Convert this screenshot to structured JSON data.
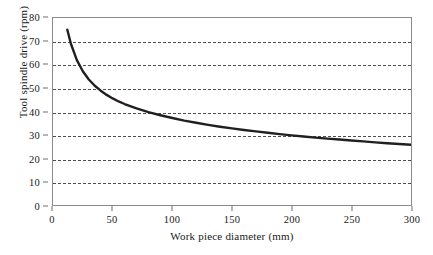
{
  "chart_data": {
    "type": "line",
    "title": "",
    "xlabel": "Work piece diameter (mm)",
    "ylabel": "Tool spindle drive (rpm)",
    "xlim": [
      0,
      300
    ],
    "ylim": [
      0,
      80
    ],
    "xticks": [
      0,
      50,
      100,
      150,
      200,
      250,
      300
    ],
    "yticks": [
      0,
      10,
      20,
      30,
      40,
      50,
      60,
      70,
      80
    ],
    "grid": "horizontal-dashed",
    "legend": "none",
    "series": [
      {
        "name": "Tool spindle drive",
        "color": "#231f20",
        "linewidth": 2.4,
        "x": [
          12,
          15,
          20,
          25,
          30,
          35,
          40,
          45,
          50,
          55,
          60,
          70,
          80,
          90,
          100,
          110,
          120,
          130,
          140,
          150,
          160,
          170,
          180,
          190,
          200,
          210,
          220,
          230,
          240,
          250,
          260,
          270,
          280,
          290,
          300
        ],
        "y": [
          75.0,
          69.0,
          62.0,
          57.2,
          53.7,
          51.0,
          48.9,
          47.1,
          45.6,
          44.3,
          43.2,
          41.3,
          39.7,
          38.4,
          37.2,
          36.1,
          35.2,
          34.3,
          33.5,
          32.8,
          32.1,
          31.5,
          30.9,
          30.3,
          29.8,
          29.3,
          28.8,
          28.4,
          28.0,
          27.6,
          27.2,
          26.8,
          26.4,
          26.1,
          25.8
        ]
      }
    ],
    "y_tick_labels": [
      "0",
      "10",
      "20",
      "30",
      "40",
      "50",
      "60",
      "70",
      "80"
    ],
    "x_tick_labels": [
      "0",
      "50",
      "100",
      "150",
      "200",
      "250",
      "300"
    ]
  },
  "style": {
    "frame_color": "#8a8a8a",
    "grid_color": "#4d4d4d",
    "curve_color": "#231f20",
    "background": "#ffffff",
    "text_color": "#1a1a1a"
  }
}
